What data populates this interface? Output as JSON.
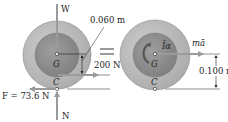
{
  "diagram": {
    "type": "free-body-diagram-equivalence",
    "left": {
      "forces": {
        "weight_label": "W",
        "normal_label": "N",
        "friction_label": "F = 73.6 N",
        "applied_label": "200 N"
      },
      "points": {
        "center_label": "G",
        "contact_label": "C"
      },
      "dimension_label": "0.060 m"
    },
    "equals_sign": "=",
    "right": {
      "labels": {
        "moment_label": "Īα",
        "inertia_label": "mā"
      },
      "points": {
        "center_label": "G",
        "contact_label": "C"
      },
      "dimension_label": "0.100 m"
    },
    "colors": {
      "outer_disk": "#b9b9b9",
      "inner_disk": "#8f8f8f",
      "arrow": "#9a9a9a",
      "line": "#222222"
    }
  }
}
